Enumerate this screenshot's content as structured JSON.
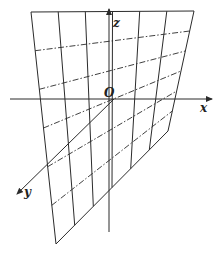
{
  "diagram": {
    "axes": {
      "x_label": "x",
      "y_label": "y",
      "z_label": "z",
      "origin_label": "O"
    },
    "surface": {
      "corners": {
        "top_left": [
          31,
          12
        ],
        "top_right": [
          194,
          11
        ],
        "bottom_left": [
          56,
          244
        ],
        "right_lower": [
          168,
          131
        ]
      },
      "solid_rulings": 6,
      "dashdot_rulings": 6
    },
    "colors": {
      "line": "#2b2b2b",
      "background": "#ffffff"
    }
  }
}
